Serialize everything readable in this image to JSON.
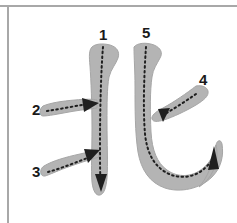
{
  "meta": {
    "kind": "stroke-order-diagram",
    "character": "北",
    "stroke_count": 5,
    "background_color": "#ffffff",
    "stroke_fill_color": "#b4b4b4",
    "stroke_edge_color": "#a0a0a0",
    "guide_dot_color": "#1f1f1f",
    "arrow_color": "#1f1f1f",
    "label_color": "#1a1a1a",
    "frame_line_color": "#a8a8a8"
  },
  "frame": {
    "top_rule_label": "top-border-rule",
    "left_rule_label": "left-border-rule"
  },
  "labels": {
    "stroke1": "1",
    "stroke2": "2",
    "stroke3": "3",
    "stroke4": "4",
    "stroke5": "5"
  },
  "strokes": [
    {
      "index": 1,
      "label": "1",
      "name": "left-vertical-stroke",
      "direction": "top-to-bottom",
      "label_position": {
        "x": 99,
        "y": 27
      },
      "start_point": {
        "x": 103,
        "y": 47
      },
      "end_point": {
        "x": 102,
        "y": 192
      }
    },
    {
      "index": 2,
      "label": "2",
      "name": "upper-horizontal-stroke",
      "direction": "left-to-right",
      "label_position": {
        "x": 32,
        "y": 102
      },
      "start_point": {
        "x": 45,
        "y": 110
      },
      "end_point": {
        "x": 95,
        "y": 103
      }
    },
    {
      "index": 3,
      "label": "3",
      "name": "lower-rising-stroke",
      "direction": "lower-left-to-upper-right",
      "label_position": {
        "x": 32,
        "y": 164
      },
      "start_point": {
        "x": 46,
        "y": 172
      },
      "end_point": {
        "x": 94,
        "y": 153
      }
    },
    {
      "index": 4,
      "label": "4",
      "name": "right-falling-stroke",
      "direction": "upper-right-to-lower-left",
      "label_position": {
        "x": 199,
        "y": 72
      },
      "start_point": {
        "x": 199,
        "y": 92
      },
      "end_point": {
        "x": 156,
        "y": 117
      }
    },
    {
      "index": 5,
      "label": "5",
      "name": "vertical-bend-hook-stroke",
      "direction": "top-down-then-right-then-hook-up",
      "label_position": {
        "x": 142,
        "y": 25
      },
      "start_point": {
        "x": 146,
        "y": 46
      },
      "end_point": {
        "x": 214,
        "y": 152
      }
    }
  ]
}
